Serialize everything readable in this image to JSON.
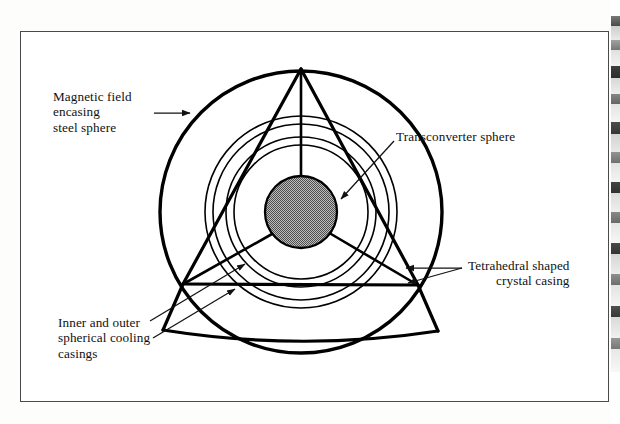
{
  "figure": {
    "type": "technical-diagram",
    "background_color": "#ffffff",
    "line_color": "#000000",
    "frame": {
      "border_color": "#4a4a4a",
      "x": 20,
      "y": 31,
      "width": 589,
      "height": 371
    }
  },
  "labels": {
    "magnetic_field": "Magnetic field\nencasing\nsteel sphere",
    "transconverter": "Transconverter sphere",
    "tetrahedral": "Tetrahedral shaped\ncrystal casing",
    "cooling": "Inner and outer\nspherical cooling\ncasings"
  },
  "geometry": {
    "center": {
      "x": 301,
      "y": 212
    },
    "circles": [
      {
        "name": "magnetic-field-outer-circle",
        "radius": 141,
        "stroke_width": 3.4
      },
      {
        "name": "outer-cooling-casing-circle",
        "radius": 96,
        "stroke_width": 1.5
      },
      {
        "name": "outer-cooling-casing-inner-circle",
        "radius": 88,
        "stroke_width": 1.5
      },
      {
        "name": "inner-cooling-casing-circle",
        "radius": 75,
        "stroke_width": 1.5
      },
      {
        "name": "inner-cooling-casing-inner-circle",
        "radius": 67,
        "stroke_width": 1.5
      },
      {
        "name": "transconverter-sphere",
        "radius": 36,
        "stroke_width": 2.2,
        "fill": "hatched-gray"
      }
    ],
    "tetrahedron": {
      "apex": {
        "x": 301,
        "y": 69
      },
      "bottom_left": {
        "x": 183,
        "y": 284
      },
      "bottom_right": {
        "x": 418,
        "y": 285
      },
      "stroke_width": 3.2
    },
    "sphere_fill": {
      "base_color": "#b4b4b4",
      "hatch_color": "#5a5a5a",
      "outline_color": "#000000"
    }
  },
  "leaders": [
    {
      "name": "magnetic-field-leader",
      "from": {
        "x": 154,
        "y": 113
      },
      "to": {
        "x": 192,
        "y": 113
      }
    },
    {
      "name": "transconverter-leader",
      "from": {
        "x": 392,
        "y": 142
      },
      "to": {
        "x": 339,
        "y": 200
      }
    },
    {
      "name": "tetrahedral-leader-upper",
      "from": {
        "x": 463,
        "y": 268
      },
      "to": {
        "x": 404,
        "y": 268
      }
    },
    {
      "name": "tetrahedral-leader-lower",
      "from": {
        "x": 463,
        "y": 268
      },
      "to": {
        "x": 406,
        "y": 284
      }
    },
    {
      "name": "cooling-leader-upper",
      "from": {
        "x": 150,
        "y": 322
      },
      "to": {
        "x": 243,
        "y": 265
      }
    },
    {
      "name": "cooling-leader-lower",
      "from": {
        "x": 152,
        "y": 339
      },
      "to": {
        "x": 233,
        "y": 290
      }
    }
  ]
}
